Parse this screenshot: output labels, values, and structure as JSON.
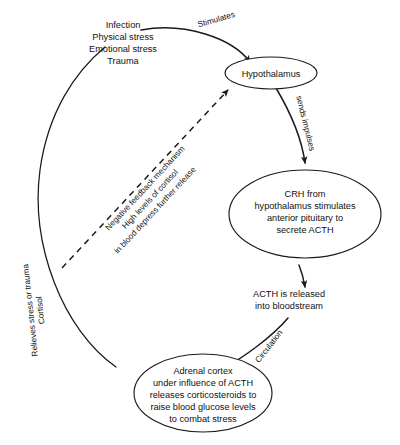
{
  "diagram": {
    "background_color": "#ffffff",
    "line_color": "#1a1a1a",
    "text_color": "#111111"
  },
  "stressors": {
    "line1": "Infection",
    "line2": "Physical stress",
    "line3": "Emotional stress",
    "line4": "Trauma"
  },
  "nodes": {
    "hypothalamus": {
      "line1": "Hypothalamus"
    },
    "crh": {
      "line1": "CRH from",
      "line2": "hypothalamus stimulates",
      "line3": "anterior pituitary to",
      "line4": "secrete ACTH"
    },
    "adrenal_cortex": {
      "line1": "Adrenal cortex",
      "line2": "under influence of ACTH",
      "line3": "releases corticosteroids to",
      "line4": "raise blood glucose levels",
      "line5": "to combat stress"
    }
  },
  "free_text": {
    "acth_release_line1": "ACTH is released",
    "acth_release_line2": "into bloodstream"
  },
  "edge_labels": {
    "stimulates": "Stimulates",
    "sends_impulses": "sends impulses",
    "circulation": "Circulation",
    "cortisol": "Cortisol",
    "relieves_stress": "Relieves stress or trauma",
    "feedback_line1": "Negative feedback mechanism",
    "feedback_line2": "High levels of cortisol",
    "feedback_line3": "in blood depress further release"
  }
}
